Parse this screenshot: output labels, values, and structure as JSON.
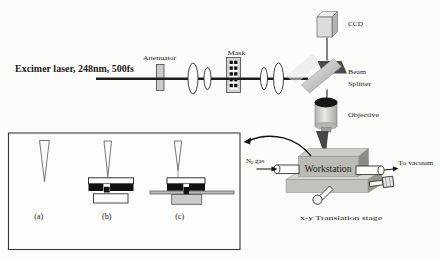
{
  "figure": {
    "laser_label": "Excimer laser, 248nm, 500fs",
    "labels": {
      "attenuator": "Attenuator",
      "mask": "Mask",
      "ccd": "CCD",
      "beam_splitter_1": "Beam",
      "beam_splitter_2": "Splitter",
      "objective": "Objective",
      "workstation": "Workstation",
      "translation_stage": "x-y Translation stage",
      "n2_base": "N",
      "n2_sub": "2",
      "n2_rest": "gas",
      "to_vacuum": "To vacuum"
    },
    "inset": {
      "label_a": "(a)",
      "label_b": "(b)",
      "label_c": "(c)"
    },
    "colors": {
      "line": "#1c1c1c",
      "light_gray": "#d4d4d0",
      "mid_gray": "#bcbcb6",
      "dark_gray": "#4a4a48"
    }
  }
}
